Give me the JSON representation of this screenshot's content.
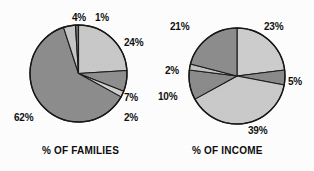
{
  "page": {
    "width": 314,
    "height": 171,
    "background": "#fefefe"
  },
  "chart_data": [
    {
      "type": "pie",
      "title": "% OF FAMILIES",
      "name": "families-pie",
      "center": [
        78.5,
        73.5
      ],
      "radius": 48.5,
      "start_angle_deg": -90,
      "direction": "clockwise",
      "categories": [
        "24%",
        "7%",
        "2%",
        "62%",
        "4%",
        "1%"
      ],
      "values": [
        24,
        7,
        2,
        62,
        4,
        1
      ],
      "colors": [
        "#c9c9c9",
        "#8f8f8f",
        "#cfcfcf",
        "#8d8d8d",
        "#c6c6c6",
        "#6e6e6e"
      ],
      "slice_labels": [
        {
          "text": "24%",
          "x": 124,
          "y": 38
        },
        {
          "text": "7%",
          "x": 124,
          "y": 93
        },
        {
          "text": "2%",
          "x": 124,
          "y": 113
        },
        {
          "text": "62%",
          "x": 14,
          "y": 113
        },
        {
          "text": "4%",
          "x": 72,
          "y": 13
        },
        {
          "text": "1%",
          "x": 95,
          "y": 13
        }
      ]
    },
    {
      "type": "pie",
      "title": "% OF INCOME",
      "name": "income-pie",
      "center": [
        236.5,
        76
      ],
      "radius": 48,
      "start_angle_deg": -90,
      "direction": "clockwise",
      "categories": [
        "23%",
        "5%",
        "39%",
        "10%",
        "2%",
        "21%"
      ],
      "values": [
        23,
        5,
        39,
        10,
        2,
        21
      ],
      "colors": [
        "#cdcdcd",
        "#8a8a8a",
        "#cacaca",
        "#8b8b8b",
        "#c2c2c2",
        "#8d8d8d"
      ],
      "slice_labels": [
        {
          "text": "23%",
          "x": 264,
          "y": 22
        },
        {
          "text": "5%",
          "x": 288,
          "y": 77
        },
        {
          "text": "39%",
          "x": 248,
          "y": 126
        },
        {
          "text": "10%",
          "x": 158,
          "y": 92
        },
        {
          "text": "2%",
          "x": 165,
          "y": 66
        },
        {
          "text": "21%",
          "x": 170,
          "y": 22
        }
      ]
    }
  ],
  "captions": [
    {
      "name": "families-caption",
      "text": "% OF FAMILIES",
      "x": 42,
      "y": 146
    },
    {
      "name": "income-caption",
      "text": "% OF INCOME",
      "x": 192,
      "y": 146
    }
  ]
}
